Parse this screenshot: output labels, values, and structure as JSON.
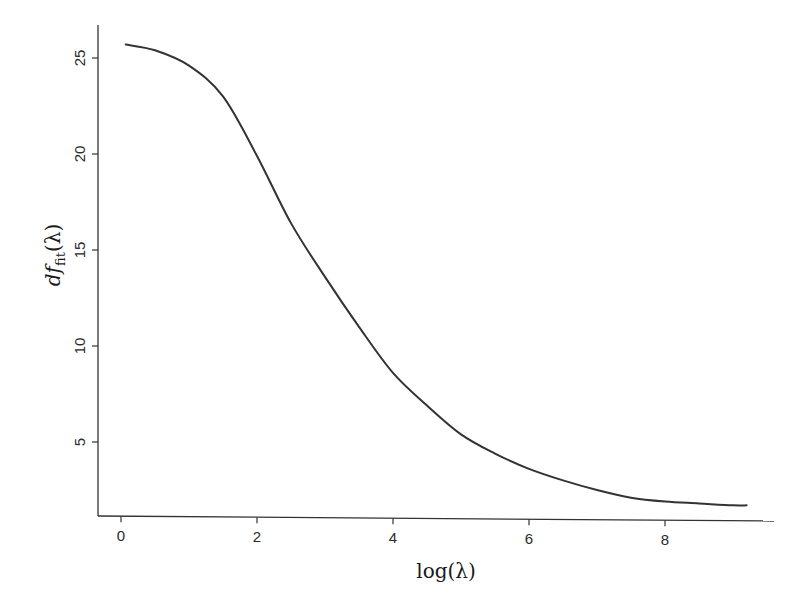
{
  "chart_data": {
    "type": "line",
    "title": "",
    "xlabel": "log(λ)",
    "ylabel": "df_fit(λ)",
    "ylabel_parts": {
      "main": "df",
      "sub": "fit",
      "arg": "(λ)"
    },
    "xlim": [
      -0.35,
      9.8
    ],
    "ylim": [
      1.0,
      26.7
    ],
    "grid": false,
    "legend": null,
    "x_ticks": [
      0,
      2,
      4,
      6,
      8
    ],
    "x_tick_labels": [
      "0",
      "2",
      "4",
      "6",
      "8"
    ],
    "y_ticks": [
      5,
      10,
      15,
      20,
      25
    ],
    "y_tick_labels": [
      "5",
      "10",
      "15",
      "20",
      "25"
    ],
    "series": [
      {
        "name": "df_fit",
        "color": "#333333",
        "x": [
          0.07,
          0.5,
          1.0,
          1.5,
          2.0,
          2.5,
          3.0,
          3.5,
          4.0,
          4.5,
          5.0,
          5.5,
          6.0,
          6.5,
          7.0,
          7.5,
          8.0,
          8.5,
          9.0,
          9.2
        ],
        "values": [
          25.7,
          25.4,
          24.6,
          23.0,
          19.9,
          16.4,
          13.6,
          11.0,
          8.6,
          6.9,
          5.4,
          4.4,
          3.6,
          3.0,
          2.5,
          2.1,
          1.9,
          1.8,
          1.7,
          1.7
        ]
      }
    ]
  }
}
